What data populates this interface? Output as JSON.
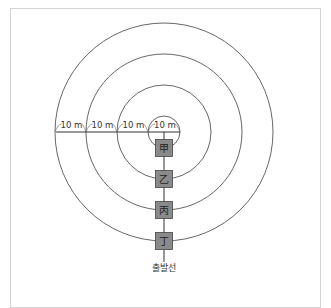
{
  "diagram": {
    "distance_labels": [
      "10 m",
      "10 m",
      "10 m",
      "10 m"
    ],
    "runners": [
      {
        "label": "甲"
      },
      {
        "label": "乙"
      },
      {
        "label": "丙"
      },
      {
        "label": "丁"
      }
    ],
    "start_line_label": "출발선",
    "ring_count": 4,
    "ring_spacing_m": 10
  }
}
